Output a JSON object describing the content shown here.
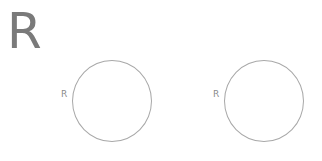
{
  "heading": "R",
  "circles": [
    {
      "label": "R",
      "color": "#a8a8a8"
    },
    {
      "label": "R",
      "color": "#a8a8a8"
    }
  ]
}
